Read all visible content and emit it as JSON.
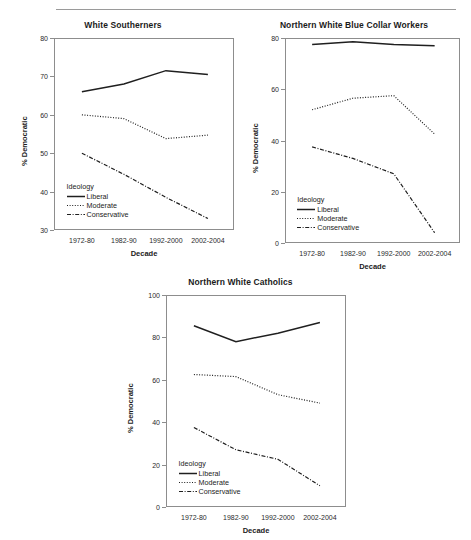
{
  "figure": {
    "series_names": [
      "Liberal",
      "Moderate",
      "Conservative"
    ],
    "legend_title": "Ideology",
    "xlabel": "Decade",
    "ylabel": "% Democratic",
    "categories": [
      "1972-80",
      "1982-90",
      "1992-2000",
      "2002-2004"
    ]
  },
  "chart_data": [
    {
      "type": "line",
      "title": "White Southerners",
      "xlabel": "Decade",
      "ylabel": "% Democratic",
      "categories": [
        "1972-80",
        "1982-90",
        "1992-2000",
        "2002-2004"
      ],
      "ylim": [
        30,
        80
      ],
      "yticks": [
        30,
        40,
        50,
        60,
        70,
        80
      ],
      "grid": false,
      "legend_title": "Ideology",
      "legend_position": "inside-bottom-left",
      "series": [
        {
          "name": "Liberal",
          "style": "solid",
          "values": [
            66.0,
            68.0,
            71.5,
            70.5
          ]
        },
        {
          "name": "Moderate",
          "style": "dotted",
          "values": [
            60.0,
            59.0,
            53.8,
            54.7
          ]
        },
        {
          "name": "Conservative",
          "style": "dashdot",
          "values": [
            50.0,
            44.5,
            38.5,
            33.0
          ]
        }
      ]
    },
    {
      "type": "line",
      "title": "Northern White Blue Collar Workers",
      "xlabel": "Decade",
      "ylabel": "% Democratic",
      "categories": [
        "1972-80",
        "1982-90",
        "1992-2000",
        "2002-2004"
      ],
      "ylim": [
        0,
        80
      ],
      "yticks": [
        0,
        20,
        40,
        60,
        80
      ],
      "grid": false,
      "legend_title": "Ideology",
      "legend_position": "inside-bottom-left",
      "series": [
        {
          "name": "Liberal",
          "style": "solid",
          "values": [
            77.5,
            78.5,
            77.5,
            77.0
          ]
        },
        {
          "name": "Moderate",
          "style": "dotted",
          "values": [
            52.0,
            56.5,
            57.5,
            42.5
          ]
        },
        {
          "name": "Conservative",
          "style": "dashdot",
          "values": [
            37.5,
            33.0,
            27.0,
            4.0
          ]
        }
      ]
    },
    {
      "type": "line",
      "title": "Northern White Catholics",
      "xlabel": "Decade",
      "ylabel": "% Democratic",
      "categories": [
        "1972-80",
        "1982-90",
        "1992-2000",
        "2002-2004"
      ],
      "ylim": [
        0,
        100
      ],
      "yticks": [
        0,
        20,
        40,
        60,
        80,
        100
      ],
      "grid": false,
      "legend_title": "Ideology",
      "legend_position": "inside-bottom-left",
      "series": [
        {
          "name": "Liberal",
          "style": "solid",
          "values": [
            85.5,
            78.0,
            82.0,
            87.0
          ]
        },
        {
          "name": "Moderate",
          "style": "dotted",
          "values": [
            62.5,
            61.5,
            53.0,
            49.0
          ]
        },
        {
          "name": "Conservative",
          "style": "dashdot",
          "values": [
            37.5,
            27.0,
            22.5,
            10.0
          ]
        }
      ]
    }
  ],
  "colors": {
    "line": "#1f1f1f",
    "frame": "#8d8d8d",
    "text": "#1b1b1b",
    "rule": "#9a9a9a",
    "background": "#ffffff"
  }
}
